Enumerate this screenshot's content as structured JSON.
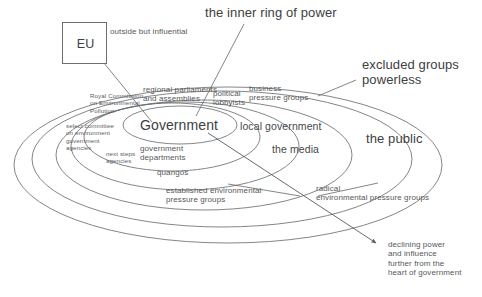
{
  "diagram": {
    "title_note": "the inner ring of power",
    "eu": {
      "box_label": "EU",
      "annotation": "outside but influential"
    },
    "labels": {
      "inner_ring_of_power": "the inner ring of power",
      "excluded_groups": "excluded groups\npowerless",
      "government": "Government",
      "regional_parliaments": "regional parliaments\nand assemblies",
      "political_lobbyists": "political\nlobbyists",
      "business_pressure_groups": "business\npressure groups",
      "local_government": "local government",
      "the_media": "the media",
      "the_public": "the public",
      "royal_commission": "Royal Commission\non Environmental\nPollution",
      "select_committee": "select committee\non environment\ngovernment\nagencies",
      "next_steps_agencies": "next steps\nagencies",
      "government_departments": "government\ndepartments",
      "quangos": "quangos",
      "established_pressure_groups": "established environmental\npressure groups",
      "radical_pressure_groups": "radical\nenvironmental pressure groups",
      "declining_power": "declining power\nand influence\nfurther from the\nheart of government"
    },
    "colors": {
      "stroke": "#6b6f71",
      "text": "#44484a",
      "background": "#ffffff"
    }
  }
}
